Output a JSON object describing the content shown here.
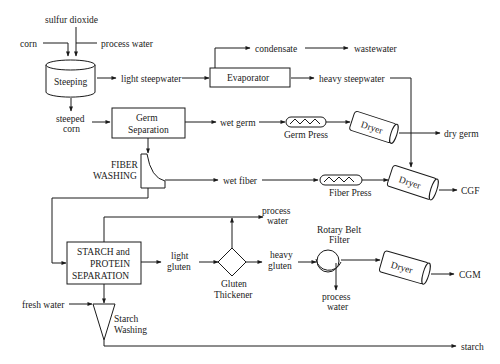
{
  "colors": {
    "line": "#1a1a1a",
    "background": "#ffffff"
  },
  "inputs": {
    "sulfur_dioxide": "sulfur dioxide",
    "corn": "corn",
    "process_water_in": "process water",
    "fresh_water": "fresh water"
  },
  "units": {
    "steeping": "Steeping",
    "evaporator": "Evaporator",
    "germ_separation_1": "Germ",
    "germ_separation_2": "Separation",
    "germ_press": "Germ Press",
    "fiber_washing_1": "FIBER",
    "fiber_washing_2": "WASHING",
    "fiber_press": "Fiber Press",
    "dryer_germ": "Dryer",
    "dryer_fiber": "Dryer",
    "dryer_gluten": "Dryer",
    "starch_protein_1": "STARCH and",
    "starch_protein_2": "PROTEIN",
    "starch_protein_3": "SEPARATION",
    "gluten_thickener_1": "Gluten",
    "gluten_thickener_2": "Thickener",
    "rotary_belt_filter_1": "Rotary Belt",
    "rotary_belt_filter_2": "Filter",
    "starch_washing_1": "Starch",
    "starch_washing_2": "Washing"
  },
  "streams": {
    "light_steepwater": "light steepwater",
    "condensate": "condensate",
    "wastewater": "wastewater",
    "heavy_steepwater": "heavy steepwater",
    "steeped_corn_1": "steeped",
    "steeped_corn_2": "corn",
    "wet_germ": "wet germ",
    "wet_fiber": "wet fiber",
    "process_water_thickener_1": "process",
    "process_water_thickener_2": "water",
    "light_gluten_1": "light",
    "light_gluten_2": "gluten",
    "heavy_gluten_1": "heavy",
    "heavy_gluten_2": "gluten",
    "process_water_filter_1": "process",
    "process_water_filter_2": "water"
  },
  "outputs": {
    "dry_germ": "dry germ",
    "cgf": "CGF",
    "cgm": "CGM",
    "starch": "starch"
  }
}
